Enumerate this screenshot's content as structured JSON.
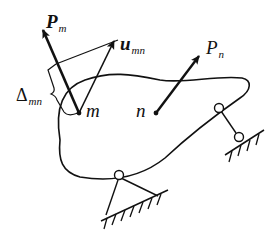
{
  "diagram": {
    "title": "",
    "labels": {
      "force_m": {
        "symbol": "P",
        "subscript": "m"
      },
      "displacement_mn": {
        "symbol": "u",
        "subscript": "mn"
      },
      "force_n": {
        "symbol": "P",
        "subscript": "n"
      },
      "delta_mn": {
        "symbol": "Δ",
        "subscript": "mn"
      },
      "point_m": "m",
      "point_n": "n"
    },
    "elements": [
      "elastic body (closed curve)",
      "force vector P_m at point m",
      "displacement vector u_mn at point m",
      "projection line from u_mn tip to P_m",
      "brace marking projection Δ_mn",
      "force vector P_n at point n",
      "pinned support (two links) at bottom",
      "roller support (single link) at right"
    ],
    "colors": {
      "stroke": "#111111",
      "background": "#ffffff"
    }
  }
}
